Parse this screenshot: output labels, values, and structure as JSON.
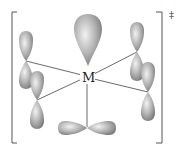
{
  "diagram": {
    "center_label": "M",
    "charge_symbol": "‡",
    "colors": {
      "lobe_fill_light": "#e8e8e8",
      "lobe_fill_dark": "#8a8a8a",
      "bond_line": "#444444",
      "bracket": "#555555"
    },
    "orbitals": [
      {
        "name": "top-lobe",
        "type": "hybrid"
      },
      {
        "name": "left-upper-p",
        "type": "p"
      },
      {
        "name": "left-lower-p",
        "type": "p"
      },
      {
        "name": "right-upper-p",
        "type": "p"
      },
      {
        "name": "right-lower-p",
        "type": "p"
      },
      {
        "name": "bottom-p",
        "type": "p"
      }
    ]
  }
}
